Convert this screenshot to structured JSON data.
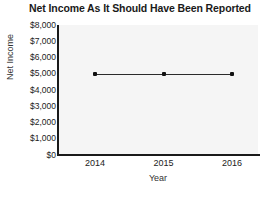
{
  "chart_data": {
    "type": "line",
    "title": "Net Income As It Should Have Been Reported",
    "xlabel": "Year",
    "ylabel": "Net Income",
    "categories": [
      "2014",
      "2015",
      "2016"
    ],
    "values": [
      5000,
      5000,
      5000
    ],
    "series": [
      {
        "name": "Net Income",
        "values": [
          5000,
          5000,
          5000
        ],
        "color": "#2b2b2b",
        "marker": "square"
      }
    ],
    "ylim": [
      0,
      8000
    ],
    "ytick_values": [
      0,
      1000,
      2000,
      3000,
      4000,
      5000,
      6000,
      7000,
      8000
    ],
    "ytick_labels": [
      "$0",
      "$1,000",
      "$2,000",
      "$3,000",
      "$4,000",
      "$5,000",
      "$6,000",
      "$7,000",
      "$8,000"
    ],
    "xtick_labels": [
      "2014",
      "2015",
      "2016"
    ],
    "grid": false,
    "legend": false,
    "plot_background": "#f5f5f5",
    "axis_color": "#1a1a1a"
  }
}
